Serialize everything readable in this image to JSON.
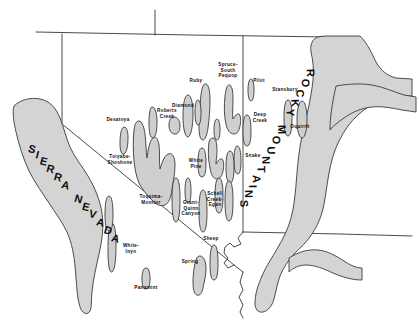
{
  "figure": {
    "kind": "physiographic-map",
    "region": "Great Basin, western United States",
    "background_color": "#ffffff",
    "range_fill_color": "#cfcfcf",
    "range_outline_color": "#3a3a3a",
    "border_color": "#2b2b2b",
    "label_color": "#0d0d0d"
  },
  "province_labels": [
    {
      "id": "sierra-nevada",
      "text": "SIERRA NEVADA",
      "letters": [
        "S",
        "I",
        "E",
        "R",
        "R",
        "A",
        " ",
        "N",
        "E",
        "V",
        "A",
        "D",
        "A"
      ]
    },
    {
      "id": "rocky-mountains",
      "text": "ROCKY MOUNTAINS",
      "letters": [
        "R",
        "O",
        "C",
        "K",
        "Y",
        " ",
        "M",
        "O",
        "U",
        "N",
        "T",
        "A",
        "I",
        "N",
        "S"
      ]
    }
  ],
  "range_labels": [
    {
      "id": "desatoya",
      "text": "Desatoya",
      "x": 118,
      "y": 120,
      "lines": [
        "Desatoya"
      ]
    },
    {
      "id": "toiyabe-shoshone",
      "text": "Toiyabe-Shoshone",
      "x": 120,
      "y": 160,
      "lines": [
        "Toiyabe-",
        "Shoshone"
      ]
    },
    {
      "id": "roberts-creek",
      "text": "Roberts Creek",
      "x": 167,
      "y": 114,
      "lines": [
        "Roberts",
        "Creek"
      ]
    },
    {
      "id": "diamond",
      "text": "Diamond",
      "x": 183,
      "y": 106,
      "lines": [
        "Diamond"
      ]
    },
    {
      "id": "ruby",
      "text": "Ruby",
      "x": 196,
      "y": 81,
      "lines": [
        "Ruby"
      ]
    },
    {
      "id": "spruce-south-pequop",
      "text": "Spruce-South Pequop",
      "x": 228,
      "y": 70,
      "lines": [
        "Spruce-",
        "South",
        "Pequop"
      ]
    },
    {
      "id": "pilot",
      "text": "Pilot",
      "x": 259,
      "y": 81,
      "lines": [
        "Pilot"
      ]
    },
    {
      "id": "stansbury",
      "text": "Stansbury",
      "x": 285,
      "y": 90,
      "lines": [
        "Stansbury"
      ]
    },
    {
      "id": "oquirrh",
      "text": "Oquirrh",
      "x": 300,
      "y": 127,
      "lines": [
        "Oquirrh"
      ]
    },
    {
      "id": "deep-creek",
      "text": "Deep Creek",
      "x": 260,
      "y": 118,
      "lines": [
        "Deep",
        "Creek"
      ]
    },
    {
      "id": "snake",
      "text": "Snake",
      "x": 253,
      "y": 156,
      "lines": [
        "Snake"
      ]
    },
    {
      "id": "white-pine",
      "text": "White Pine",
      "x": 196,
      "y": 164,
      "lines": [
        "White",
        "Pine"
      ]
    },
    {
      "id": "schell-creek-egan",
      "text": "Schell Creek-Egan",
      "x": 215,
      "y": 199,
      "lines": [
        "Schell",
        "Creek-",
        "Egan"
      ]
    },
    {
      "id": "grant-quinn-canyon",
      "text": "Grant-Quinn Canyon",
      "x": 191,
      "y": 208,
      "lines": [
        "Grant-",
        "Quinn",
        "Canyon"
      ]
    },
    {
      "id": "toquima-monitor",
      "text": "Toquima-Monitor",
      "x": 151,
      "y": 200,
      "lines": [
        "Toquima-",
        "Monitor"
      ]
    },
    {
      "id": "white-inyo",
      "text": "White-Inyo",
      "x": 131,
      "y": 249,
      "lines": [
        "White-",
        "Inyo"
      ]
    },
    {
      "id": "panamint",
      "text": "Panamint",
      "x": 146,
      "y": 288,
      "lines": [
        "Panamint"
      ]
    },
    {
      "id": "spring",
      "text": "Spring",
      "x": 190,
      "y": 262,
      "lines": [
        "Spring"
      ]
    },
    {
      "id": "sheep",
      "text": "Sheep",
      "x": 211,
      "y": 239,
      "lines": [
        "Sheep"
      ]
    }
  ]
}
